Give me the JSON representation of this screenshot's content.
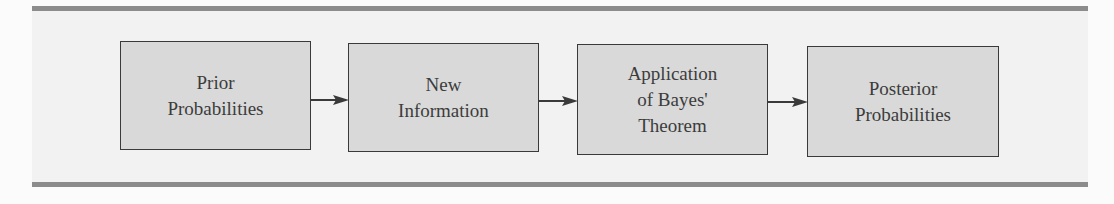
{
  "diagram": {
    "type": "flowchart",
    "direction": "left-to-right",
    "nodes": [
      {
        "id": "prior",
        "label": "Prior\nProbabilities"
      },
      {
        "id": "new_info",
        "label": "New\nInformation"
      },
      {
        "id": "bayes",
        "label": "Application\nof Bayes'\nTheorem"
      },
      {
        "id": "posterior",
        "label": "Posterior\nProbabilities"
      }
    ],
    "edges": [
      {
        "from": "prior",
        "to": "new_info"
      },
      {
        "from": "new_info",
        "to": "bayes"
      },
      {
        "from": "bayes",
        "to": "posterior"
      }
    ]
  },
  "colors": {
    "box_fill": "#d9d9d9",
    "box_border": "#3a3a3a",
    "panel": "#f2f2f2",
    "rule": "#8c8c8c",
    "text": "#3c3c3c"
  }
}
